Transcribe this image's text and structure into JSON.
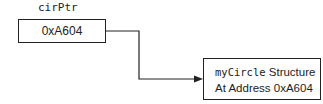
{
  "pointer": {
    "name": "cirPtr",
    "value": "0xA604"
  },
  "target": {
    "struct_name": "myCircle",
    "line1_suffix": " Structure",
    "line2": "At Address 0xA604"
  },
  "colors": {
    "stroke": "#222222",
    "background": "#ffffff"
  }
}
